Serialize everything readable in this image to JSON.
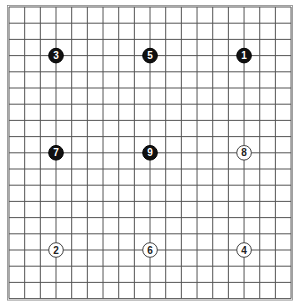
{
  "board": {
    "size": 19,
    "origin_x": 9,
    "origin_y": 7,
    "spacing_x": 15.67,
    "spacing_y": 16.2,
    "line_color": "#555555",
    "background": "#ffffff"
  },
  "stones": [
    {
      "number": "1",
      "color": "black",
      "col": 15,
      "row": 3
    },
    {
      "number": "2",
      "color": "white",
      "col": 3,
      "row": 15
    },
    {
      "number": "3",
      "color": "black",
      "col": 3,
      "row": 3
    },
    {
      "number": "4",
      "color": "white",
      "col": 15,
      "row": 15
    },
    {
      "number": "5",
      "color": "black",
      "col": 9,
      "row": 3
    },
    {
      "number": "6",
      "color": "white",
      "col": 9,
      "row": 15
    },
    {
      "number": "7",
      "color": "black",
      "col": 3,
      "row": 9
    },
    {
      "number": "8",
      "color": "white",
      "col": 15,
      "row": 9
    },
    {
      "number": "9",
      "color": "black",
      "col": 9,
      "row": 9
    }
  ]
}
